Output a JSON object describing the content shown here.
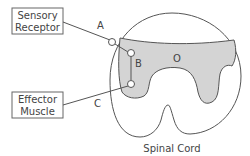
{
  "diagram": {
    "title": "Spinal Cord",
    "boxes": {
      "sensory": {
        "line1": "Sensory",
        "line2": "Receptor"
      },
      "effector": {
        "line1": "Effector",
        "line2": "Muscle"
      }
    },
    "labels": {
      "a": "A",
      "b": "B",
      "c": "C",
      "o": "O"
    },
    "colors": {
      "stroke": "#555555",
      "gray_matter": "#d4d4d4",
      "text": "#444444"
    }
  }
}
